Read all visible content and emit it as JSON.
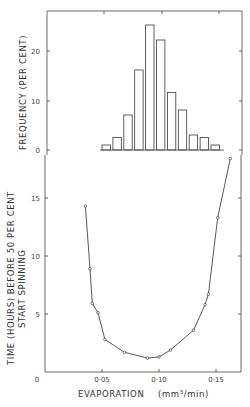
{
  "chart_data": [
    {
      "type": "bar",
      "panel": "top",
      "title": "",
      "xlabel": "",
      "ylabel": "FREQUENCY (PER CENT)",
      "ylim": [
        0,
        27
      ],
      "yticks": [
        0,
        10,
        20
      ],
      "ytick_labels": [
        "0",
        "10",
        "20"
      ],
      "categories": [
        "0.040",
        "0.050",
        "0.060",
        "0.070",
        "0.080",
        "0.090",
        "0.100",
        "0.110",
        "0.120",
        "0.130",
        "0.140"
      ],
      "values": [
        1,
        2.5,
        7,
        16,
        25,
        22,
        11.5,
        8,
        3,
        2.5,
        1
      ],
      "grid": false,
      "legend": null
    },
    {
      "type": "line",
      "panel": "bottom",
      "title": "",
      "xlabel": "EVAPORATION (mm³/min)",
      "ylabel": "TIME (HOURS) BEFORE 50 PER CENT START SPINNING",
      "xlim": [
        0,
        0.17
      ],
      "ylim": [
        0,
        20
      ],
      "xticks": [
        0,
        0.05,
        0.1,
        0.15
      ],
      "xtick_labels": [
        "0",
        "0·05",
        "0·10",
        "0·15"
      ],
      "yticks": [
        0,
        5,
        10,
        15
      ],
      "ytick_labels": [
        "0",
        "5",
        "10",
        "15"
      ],
      "x": [
        0.036,
        0.04,
        0.042,
        0.047,
        0.053,
        0.07,
        0.09,
        0.1,
        0.11,
        0.13,
        0.14,
        0.143,
        0.151,
        0.162
      ],
      "y": [
        14.3,
        8.9,
        5.9,
        5.1,
        2.8,
        1.7,
        1.2,
        1.3,
        1.9,
        3.6,
        5.8,
        6.7,
        13.3,
        18.4
      ],
      "marker": "open-circle",
      "grid": false,
      "legend": null
    }
  ],
  "labels": {
    "top_ylabel": "FREQUENCY   (PER  CENT)",
    "bottom_ylabel_line1": "TIME  (HOURS)  BEFORE  50  PER  CENT",
    "bottom_ylabel_line2": "START   SPINNING",
    "xlabel_main": "EVAPORATION",
    "xlabel_unit": "(mm³/min)",
    "top_yticks": [
      "20",
      "10",
      "0"
    ],
    "bottom_yticks": [
      "15",
      "10",
      "5",
      "0"
    ],
    "xticks": [
      "0",
      "0·05",
      "0·10",
      "0·15"
    ]
  },
  "colors": {
    "ink": "#3a3a3a",
    "background": "#ffffff"
  }
}
